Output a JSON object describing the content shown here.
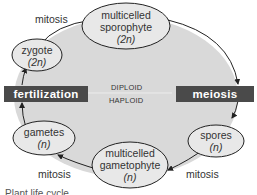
{
  "diagram": {
    "colors": {
      "cycle_fill": "#d9d9d9",
      "node_fill": "#e8e8e8",
      "bar_fill": "#4a4a4a",
      "stroke": "#222222"
    },
    "nodes": {
      "sporophyte": {
        "line1": "multicelled",
        "line2": "sporophyte",
        "ploidy": "(2n)"
      },
      "zygote": {
        "line1": "zygote",
        "ploidy": "(2n)"
      },
      "gametes": {
        "line1": "gametes",
        "ploidy": "(n)"
      },
      "gametophyte": {
        "line1": "multicelled",
        "line2": "gametophyte",
        "ploidy": "(n)"
      },
      "spores": {
        "line1": "spores",
        "ploidy": "(n)"
      }
    },
    "processes": {
      "mitosis_top": "mitosis",
      "mitosis_bottom_left": "mitosis",
      "mitosis_bottom_right": "mitosis",
      "fertilization": "fertilization",
      "meiosis": "meiosis"
    },
    "phases": {
      "diploid": "DIPLOID",
      "haploid": "HAPLOID"
    },
    "caption": "Plant life cycle"
  }
}
